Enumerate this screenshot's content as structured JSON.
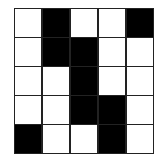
{
  "grid": {
    "rows": 5,
    "cols": 5,
    "cells": [
      [
        0,
        1,
        0,
        0,
        1
      ],
      [
        0,
        1,
        1,
        0,
        0
      ],
      [
        0,
        0,
        1,
        0,
        0
      ],
      [
        0,
        0,
        1,
        1,
        0
      ],
      [
        1,
        0,
        0,
        1,
        0
      ]
    ],
    "colors": {
      "filled": "#000000",
      "empty": "#ffffff",
      "line": "#222222"
    }
  }
}
